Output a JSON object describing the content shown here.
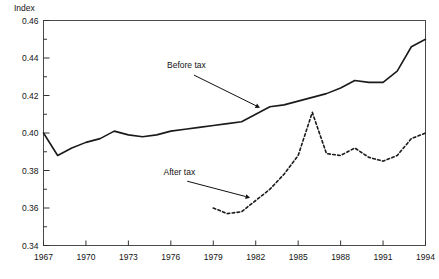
{
  "chart_data": {
    "type": "line",
    "title": "",
    "ylabel": "Index",
    "xlabel": "",
    "ylim": [
      0.34,
      0.46
    ],
    "xlim": [
      1967,
      1994
    ],
    "grid": false,
    "legend_position": "inline-annotations",
    "y_ticks": [
      "0.34",
      "0.36",
      "0.38",
      "0.40",
      "0.42",
      "0.44",
      "0.46"
    ],
    "y_tick_values": [
      0.34,
      0.36,
      0.38,
      0.4,
      0.42,
      0.44,
      0.46
    ],
    "y_minor_tick_values": [
      0.35,
      0.37,
      0.39,
      0.41,
      0.43,
      0.45
    ],
    "x_ticks": [
      "1967",
      "1970",
      "1973",
      "1976",
      "1979",
      "1982",
      "1985",
      "1988",
      "1991",
      "1994"
    ],
    "x_tick_values": [
      1967,
      1970,
      1973,
      1976,
      1979,
      1982,
      1985,
      1988,
      1991,
      1994
    ],
    "series": [
      {
        "name": "Before tax",
        "style": "solid",
        "color": "#1a1a1a",
        "x": [
          1967,
          1968,
          1969,
          1970,
          1971,
          1972,
          1973,
          1974,
          1975,
          1976,
          1977,
          1978,
          1979,
          1980,
          1981,
          1982,
          1983,
          1984,
          1985,
          1986,
          1987,
          1988,
          1989,
          1990,
          1991,
          1992,
          1993,
          1994
        ],
        "values": [
          0.4,
          0.388,
          0.392,
          0.395,
          0.397,
          0.401,
          0.399,
          0.398,
          0.399,
          0.401,
          0.402,
          0.403,
          0.404,
          0.405,
          0.406,
          0.41,
          0.414,
          0.415,
          0.417,
          0.419,
          0.421,
          0.424,
          0.428,
          0.427,
          0.427,
          0.433,
          0.446,
          0.45
        ]
      },
      {
        "name": "After tax",
        "style": "dashed",
        "color": "#1a1a1a",
        "x": [
          1979,
          1980,
          1981,
          1982,
          1983,
          1984,
          1985,
          1986,
          1987,
          1988,
          1989,
          1990,
          1991,
          1992,
          1993,
          1994
        ],
        "values": [
          0.36,
          0.357,
          0.358,
          0.364,
          0.37,
          0.378,
          0.388,
          0.411,
          0.389,
          0.388,
          0.392,
          0.387,
          0.385,
          0.388,
          0.397,
          0.4
        ]
      }
    ],
    "annotations": [
      {
        "label": "Before tax",
        "target_series": "Before tax",
        "label_x": 1977.1,
        "label_y": 0.4345,
        "point_x": 1982.3,
        "point_y": 0.4135
      },
      {
        "label": "After tax",
        "target_series": "After tax",
        "label_x": 1976.6,
        "label_y": 0.3775,
        "point_x": 1981.6,
        "point_y": 0.3655
      }
    ]
  }
}
